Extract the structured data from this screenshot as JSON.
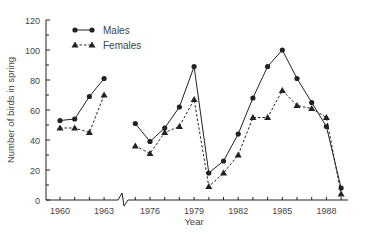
{
  "chart_data": {
    "type": "line",
    "title": "",
    "xlabel": "Year",
    "ylabel": "Number of birds in spring",
    "ylim": [
      0,
      120
    ],
    "yticks": [
      0,
      20,
      40,
      60,
      80,
      100,
      120
    ],
    "xtick_labels": [
      "1960",
      "1963",
      "1976",
      "1979",
      "1982",
      "1985",
      "1988"
    ],
    "axis_break": "between 1963 and 1975",
    "grid": false,
    "legend_position": "upper-left",
    "segments": [
      {
        "years": [
          1960,
          1961,
          1962,
          1963
        ]
      },
      {
        "years": [
          1975,
          1976,
          1977,
          1978,
          1979,
          1980,
          1981,
          1982,
          1983,
          1984,
          1985,
          1986,
          1987,
          1988,
          1989
        ]
      }
    ],
    "series": [
      {
        "name": "Males",
        "marker": "circle",
        "line": "solid",
        "x": [
          1960,
          1961,
          1962,
          1963,
          1975,
          1976,
          1977,
          1978,
          1979,
          1980,
          1981,
          1982,
          1983,
          1984,
          1985,
          1986,
          1987,
          1988,
          1989
        ],
        "values": [
          53,
          54,
          69,
          81,
          51,
          39,
          48,
          62,
          89,
          18,
          26,
          44,
          68,
          89,
          100,
          81,
          65,
          49,
          8
        ]
      },
      {
        "name": "Females",
        "marker": "triangle",
        "line": "dashed",
        "x": [
          1960,
          1961,
          1962,
          1963,
          1975,
          1976,
          1977,
          1978,
          1979,
          1980,
          1981,
          1982,
          1983,
          1984,
          1985,
          1986,
          1987,
          1988,
          1989
        ],
        "values": [
          48,
          48,
          45,
          70,
          36,
          31,
          45,
          49,
          67,
          9,
          18,
          30,
          55,
          55,
          73,
          63,
          61,
          55,
          4
        ]
      }
    ]
  },
  "colors": {
    "ink": "#222222",
    "axis": "#333333",
    "background": "#ffffff"
  }
}
